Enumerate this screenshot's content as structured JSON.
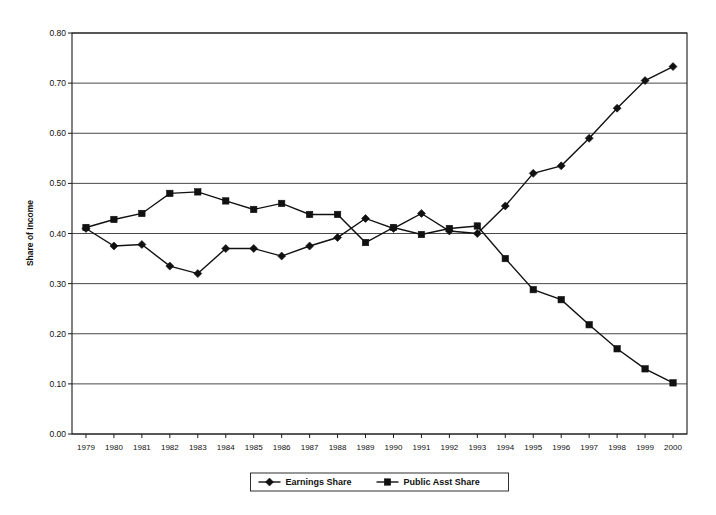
{
  "chart_data": {
    "type": "line",
    "title": "",
    "xlabel": "",
    "ylabel": "Share of Income",
    "ylim": [
      0.0,
      0.8
    ],
    "ytick_labels": [
      "0.80",
      "0.70",
      "0.60",
      "0.50",
      "0.40",
      "0.30",
      "0.20",
      "0.10",
      "0.00"
    ],
    "ytick_values": [
      0.8,
      0.7,
      0.6,
      0.5,
      0.4,
      0.3,
      0.2,
      0.1,
      0.0
    ],
    "grid": true,
    "legend_position": "bottom-center",
    "categories": [
      "1979",
      "1980",
      "1981",
      "1982",
      "1983",
      "1984",
      "1985",
      "1986",
      "1987",
      "1988",
      "1989",
      "1990",
      "1991",
      "1992",
      "1993",
      "1994",
      "1995",
      "1996",
      "1997",
      "1998",
      "1999",
      "2000"
    ],
    "x": [
      1979,
      1980,
      1981,
      1982,
      1983,
      1984,
      1985,
      1986,
      1987,
      1988,
      1989,
      1990,
      1991,
      1992,
      1993,
      1994,
      1995,
      1996,
      1997,
      1998,
      1999,
      2000
    ],
    "series": [
      {
        "name": "Earnings Share",
        "marker": "diamond",
        "values": [
          0.41,
          0.375,
          0.378,
          0.335,
          0.32,
          0.37,
          0.37,
          0.355,
          0.375,
          0.392,
          0.43,
          0.41,
          0.44,
          0.405,
          0.4,
          0.455,
          0.52,
          0.535,
          0.59,
          0.65,
          0.705,
          0.733
        ]
      },
      {
        "name": "Public Asst Share",
        "marker": "square",
        "values": [
          0.412,
          0.428,
          0.44,
          0.48,
          0.483,
          0.465,
          0.448,
          0.46,
          0.438,
          0.438,
          0.382,
          0.412,
          0.398,
          0.41,
          0.415,
          0.35,
          0.288,
          0.268,
          0.218,
          0.17,
          0.13,
          0.102
        ]
      }
    ]
  },
  "legend": {
    "items": [
      {
        "label": "Earnings Share",
        "marker": "diamond"
      },
      {
        "label": "Public Asst Share",
        "marker": "square"
      }
    ]
  }
}
